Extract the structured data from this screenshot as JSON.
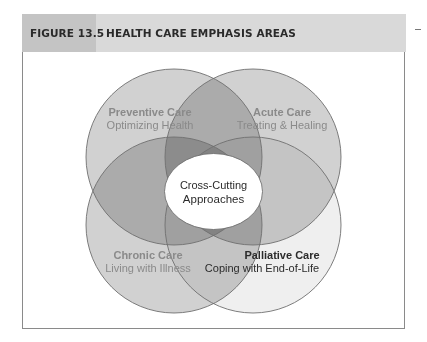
{
  "figure": {
    "number": "FIGURE 13.5",
    "title": "HEALTH CARE EMPHASIS AREAS"
  },
  "diagram": {
    "type": "venn",
    "areas": [
      {
        "id": "preventive",
        "name": "Preventive Care",
        "subtitle": "Optimizing Health",
        "position": "top-left",
        "fill": "#c9c9c9"
      },
      {
        "id": "acute",
        "name": "Acute Care",
        "subtitle": "Treating & Healing",
        "position": "top-right",
        "fill": "#c9c9c9"
      },
      {
        "id": "chronic",
        "name": "Chronic Care",
        "subtitle": "Living with Illness",
        "position": "bottom-left",
        "fill": "#c9c9c9"
      },
      {
        "id": "palliative",
        "name": "Palliative Care",
        "subtitle": "Coping with End-of-Life",
        "position": "bottom-right",
        "fill": "#ececec"
      }
    ],
    "center": {
      "line1": "Cross-Cutting",
      "line2": "Approaches"
    },
    "colors": {
      "label_gray": "#8a8a8a",
      "label_dark": "#2b2b2b",
      "outline": "#6f6f6f",
      "center_fill": "#ffffff"
    }
  }
}
